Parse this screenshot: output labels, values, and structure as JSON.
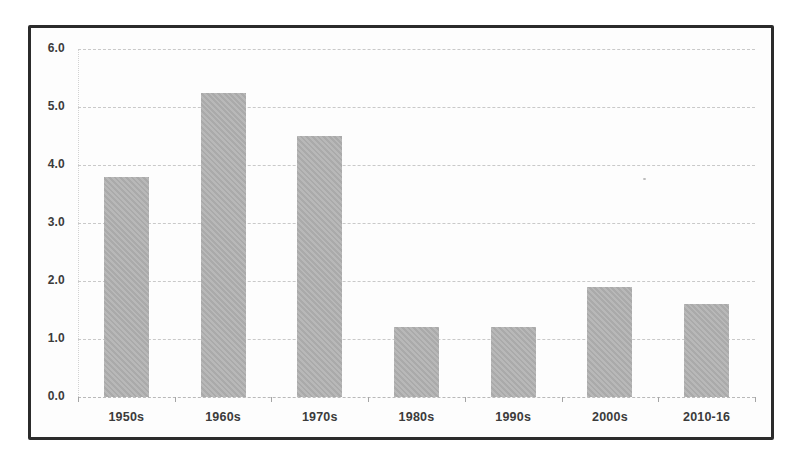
{
  "chart_data": {
    "type": "bar",
    "title": "",
    "categories": [
      "1950s",
      "1960s",
      "1970s",
      "1980s",
      "1990s",
      "2000s",
      "2010-16"
    ],
    "values": [
      3.8,
      5.25,
      4.5,
      1.2,
      1.2,
      1.9,
      1.6
    ],
    "ylim": [
      0,
      6
    ],
    "ytick_step": 1.0,
    "ytick_labels": [
      "0.0",
      "1.0",
      "2.0",
      "3.0",
      "4.0",
      "5.0",
      "6.0"
    ],
    "grid": "horizontal-dashed",
    "legend": "none",
    "colors": {
      "bar_fill": "#b3b3b3",
      "gridline": "#c9c9c9",
      "axis_label": "#3b3b3b",
      "frame_border": "#2b2b2b",
      "plot_background": "#fdfdfd",
      "page_background": "#ffffff"
    }
  }
}
